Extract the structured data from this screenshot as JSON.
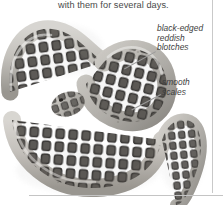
{
  "figure": {
    "caption_text": "with them for several days.",
    "background_color": "#ffffff",
    "rule_color": "#c4c4c4"
  },
  "annotations": [
    {
      "id": "blotches",
      "lines": [
        "black-edged",
        "reddish",
        "blotches"
      ],
      "style": "italic"
    },
    {
      "id": "scales",
      "lines": [
        "smooth",
        "scales"
      ],
      "style": "italic"
    }
  ],
  "artwork": {
    "name": "coiled-snake-photo",
    "body_light": "#d8d6d2",
    "body_mid": "#a9a6a1",
    "blotch_dark": "#4a4744",
    "blotch_edge": "#2b2927",
    "shadow": "#ebebeb"
  }
}
